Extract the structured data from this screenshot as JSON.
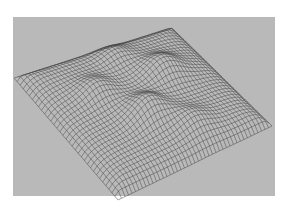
{
  "figure": {
    "background_color": "#b9b9b9",
    "border_color": "#ffffff",
    "line_color": "#3a3a3a"
  },
  "surface": {
    "grid_u": 44,
    "grid_v": 34,
    "corners": {
      "left": [
        14,
        78
      ],
      "back": [
        172,
        28
      ],
      "right": [
        272,
        126
      ],
      "front": [
        118,
        200
      ]
    },
    "corner_lift": [
      {
        "u": 0,
        "v": 0,
        "dy": -2
      },
      {
        "u": 1,
        "v": 1,
        "dy": 0
      }
    ],
    "bumps": [
      {
        "u": 0.45,
        "v": 0.62,
        "amp": 18,
        "sigma": 0.09
      },
      {
        "u": 0.7,
        "v": 0.38,
        "amp": 16,
        "sigma": 0.09
      },
      {
        "u": 0.3,
        "v": 0.35,
        "amp": 12,
        "sigma": 0.08
      },
      {
        "u": 0.62,
        "v": 0.8,
        "amp": 10,
        "sigma": 0.08
      },
      {
        "u": 0.55,
        "v": 0.15,
        "amp": 8,
        "sigma": 0.07
      }
    ],
    "edge_droop": 22
  }
}
